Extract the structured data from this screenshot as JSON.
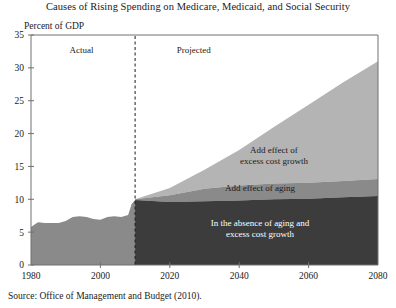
{
  "figure": {
    "title": "Causes of Rising Spending on Medicare, Medicaid, and Social Security",
    "axis_caption": "Percent of GDP",
    "source": "Source:  Office of Management and Budget (2010)."
  },
  "chart_data": {
    "type": "area",
    "title": "Causes of Rising Spending on Medicare, Medicaid, and Social Security",
    "subtitle": "",
    "xlabel": "",
    "ylabel": "Percent of GDP",
    "xlim": [
      1980,
      2080
    ],
    "ylim": [
      0,
      35
    ],
    "xticks": [
      1980,
      2000,
      2020,
      2040,
      2060,
      2080
    ],
    "yticks": [
      0,
      5,
      10,
      15,
      20,
      25,
      30,
      35
    ],
    "grid": false,
    "legend": "in-plot annotations",
    "stacked": true,
    "divider_year": 2010,
    "era_labels": [
      {
        "text": "Actual",
        "x": 1998,
        "y": 32.2
      },
      {
        "text": "Projected",
        "x": 2022,
        "y": 32.2
      }
    ],
    "annotations": [
      {
        "text": "Add effect of excess cost growth",
        "x": 2050,
        "y": 17.0,
        "color": "#1a1a1a"
      },
      {
        "text": "Add effect of aging",
        "x": 2046,
        "y": 11.3,
        "color": "#1a1a1a"
      },
      {
        "text": "In the absence of aging and excess cost growth",
        "x": 2046,
        "y": 6.0,
        "color": "#ffffff"
      }
    ],
    "colors": {
      "historical": "#8a8a8a",
      "baseline": "#3c3c3c",
      "aging": "#8a8a8a",
      "excess_cost_growth": "#b4b4b4",
      "axis": "#707070",
      "divider": "#1a1a1a"
    },
    "series": [
      {
        "name": "Actual (historical total)",
        "color": "#8a8a8a",
        "x": [
          1980,
          1982,
          1984,
          1986,
          1988,
          1990,
          1992,
          1994,
          1996,
          1998,
          2000,
          2002,
          2004,
          2006,
          2008,
          2009,
          2010
        ],
        "values": [
          5.8,
          6.5,
          6.4,
          6.4,
          6.4,
          6.7,
          7.3,
          7.4,
          7.3,
          7.0,
          6.9,
          7.3,
          7.4,
          7.3,
          7.6,
          9.3,
          9.9
        ]
      },
      {
        "name": "In the absence of aging and excess cost growth",
        "color": "#3c3c3c",
        "x": [
          2010,
          2020,
          2030,
          2040,
          2050,
          2060,
          2070,
          2080
        ],
        "values": [
          9.9,
          9.6,
          9.7,
          9.8,
          10.0,
          10.1,
          10.3,
          10.5
        ]
      },
      {
        "name": "Add effect of aging",
        "color": "#8a8a8a",
        "x": [
          2010,
          2020,
          2030,
          2040,
          2050,
          2060,
          2070,
          2080
        ],
        "values": [
          0.1,
          1.0,
          1.9,
          2.3,
          2.4,
          2.4,
          2.5,
          2.6
        ]
      },
      {
        "name": "Add effect of excess cost growth",
        "color": "#b4b4b4",
        "x": [
          2010,
          2020,
          2030,
          2040,
          2050,
          2060,
          2070,
          2080
        ],
        "values": [
          0.0,
          1.1,
          2.9,
          5.4,
          8.6,
          11.9,
          15.0,
          17.9
        ]
      }
    ],
    "cumulative_totals": {
      "x": [
        2010,
        2020,
        2030,
        2040,
        2050,
        2060,
        2070,
        2080
      ],
      "baseline": [
        9.9,
        9.6,
        9.7,
        9.8,
        10.0,
        10.1,
        10.3,
        10.5
      ],
      "plus_aging": [
        10.0,
        10.6,
        11.6,
        12.1,
        12.4,
        12.5,
        12.8,
        13.1
      ],
      "plus_excess_cost_growth": [
        10.0,
        11.7,
        14.5,
        17.5,
        21.0,
        24.4,
        27.8,
        31.0
      ]
    }
  }
}
